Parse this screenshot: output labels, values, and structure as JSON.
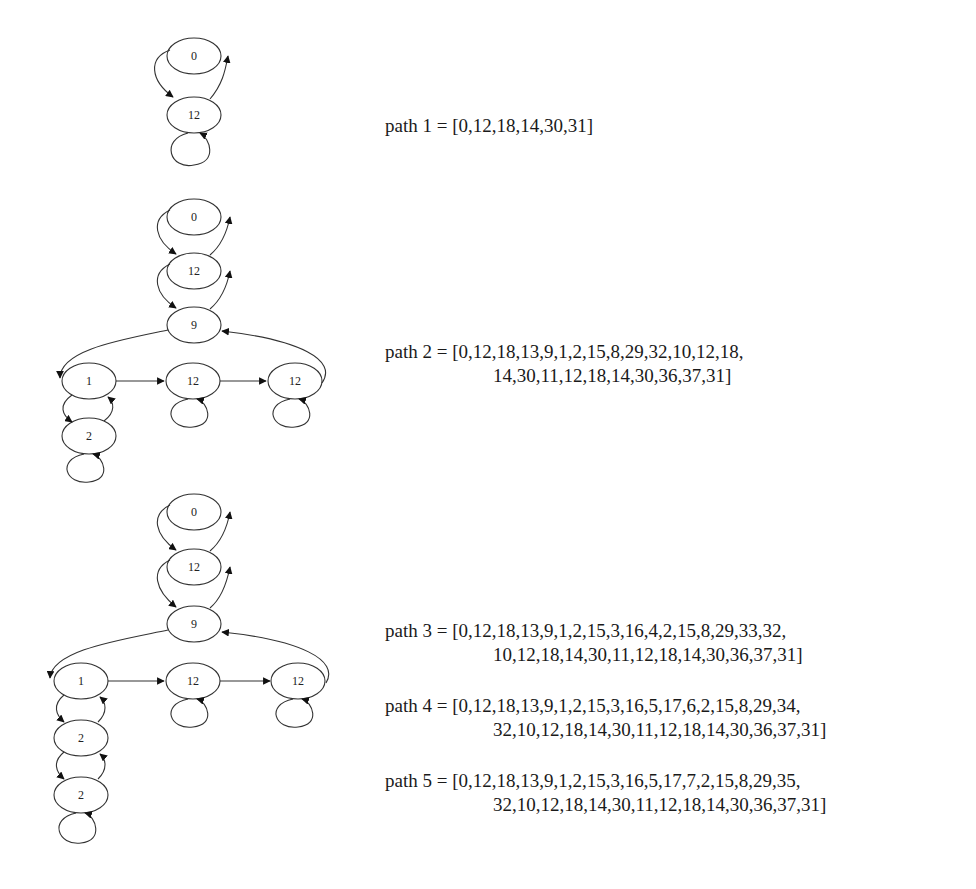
{
  "graphs": [
    {
      "id": "graph-1",
      "nodes": [
        "0",
        "12"
      ]
    },
    {
      "id": "graph-2",
      "nodes": [
        "0",
        "12",
        "9",
        "1",
        "12",
        "12",
        "2"
      ]
    },
    {
      "id": "graph-3",
      "nodes": [
        "0",
        "12",
        "9",
        "1",
        "12",
        "12",
        "2",
        "2"
      ]
    }
  ],
  "paths": [
    {
      "label": "path 1 = ",
      "line1": "[0,12,18,14,30,31]",
      "line2": ""
    },
    {
      "label": "path 2 = ",
      "line1": "[0,12,18,13,9,1,2,15,8,29,32,10,12,18,",
      "line2": "14,30,11,12,18,14,30,36,37,31]"
    },
    {
      "label": "path 3 = ",
      "line1": "[0,12,18,13,9,1,2,15,3,16,4,2,15,8,29,33,32,",
      "line2": "10,12,18,14,30,11,12,18,14,30,36,37,31]"
    },
    {
      "label": "path 4 = ",
      "line1": "[0,12,18,13,9,1,2,15,3,16,5,17,6,2,15,8,29,34,",
      "line2": "32,10,12,18,14,30,11,12,18,14,30,36,37,31]"
    },
    {
      "label": "path 5 = ",
      "line1": "[0,12,18,13,9,1,2,15,3,16,5,17,7,2,15,8,29,35,",
      "line2": "32,10,12,18,14,30,11,12,18,14,30,36,37,31]"
    }
  ]
}
